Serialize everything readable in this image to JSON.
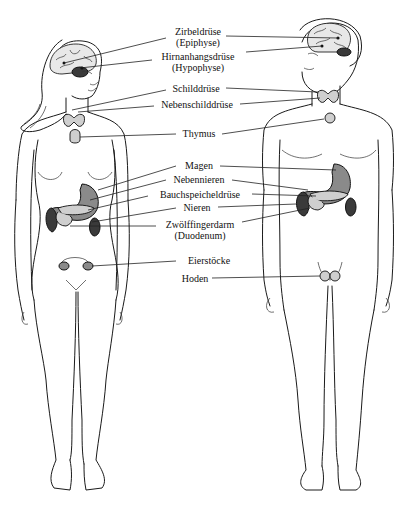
{
  "diagram": {
    "figures": [
      {
        "id": "female",
        "label": "Frau"
      },
      {
        "id": "male",
        "label": "Mann"
      }
    ],
    "labels": {
      "zirbeldruese": {
        "line1": "Zirbeldrüse",
        "line2": "(Epiphyse)"
      },
      "hirnanhangsdruese": {
        "line1": "Hirnanhangsdrüse",
        "line2": "(Hypophyse)"
      },
      "schilddruese": {
        "line1": "Schilddrüse"
      },
      "nebenschilddruese": {
        "line1": "Nebenschilddrüse"
      },
      "thymus": {
        "line1": "Thymus"
      },
      "magen": {
        "line1": "Magen"
      },
      "nebennieren": {
        "line1": "Nebennieren"
      },
      "bauchspeicheldruese": {
        "line1": "Bauchspeicheldrüse"
      },
      "nieren": {
        "line1": "Nieren"
      },
      "zwoelffingerdarm": {
        "line1": "Zwölffingerdarm",
        "line2": "(Duodenum)"
      },
      "eierstoecke": {
        "line1": "Eierstöcke"
      },
      "hoden": {
        "line1": "Hoden"
      }
    },
    "colors": {
      "background": "#ffffff",
      "line": "#1a1a1a",
      "organ_fill": "#8a8a8a"
    }
  }
}
